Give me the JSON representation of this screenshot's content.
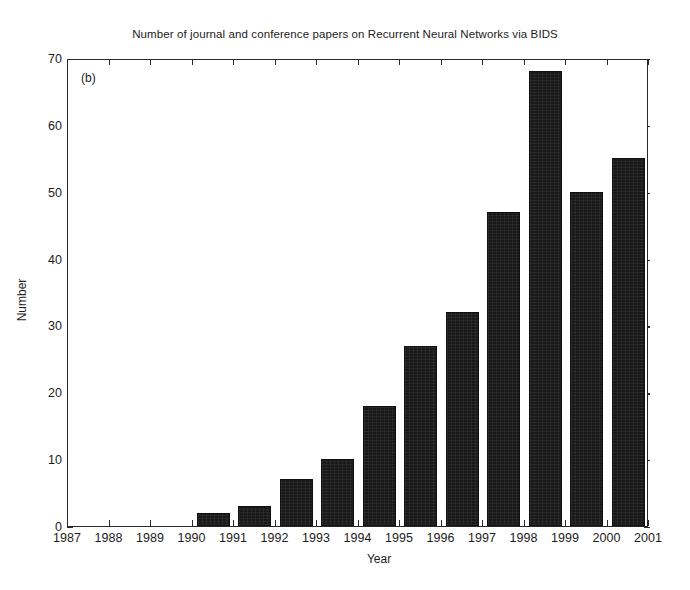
{
  "chart_data": {
    "type": "bar",
    "title": "Number of journal and conference papers on Recurrent Neural Networks via BIDS",
    "panel_label": "(b)",
    "xlabel": "Year",
    "ylabel": "Number",
    "categories": [
      "1987",
      "1988",
      "1989",
      "1990",
      "1991",
      "1992",
      "1993",
      "1994",
      "1995",
      "1996",
      "1997",
      "1998",
      "1999",
      "2000"
    ],
    "values": [
      0,
      0,
      0,
      2,
      3,
      7,
      10,
      18,
      27,
      32,
      47,
      68,
      50,
      55
    ],
    "xtick_labels": [
      "1987",
      "1988",
      "1989",
      "1990",
      "1991",
      "1992",
      "1993",
      "1994",
      "1995",
      "1996",
      "1997",
      "1998",
      "1999",
      "2000",
      "2001"
    ],
    "ytick_labels": [
      "0",
      "10",
      "20",
      "30",
      "40",
      "50",
      "60",
      "70"
    ],
    "ytick_values": [
      0,
      10,
      20,
      30,
      40,
      50,
      60,
      70
    ],
    "xlim": [
      1987,
      2001
    ],
    "ylim": [
      0,
      70
    ],
    "grid": false,
    "legend": null,
    "bar_color": "#191919",
    "axis_color": "#2a2a2a",
    "background_color": "#ffffff"
  }
}
